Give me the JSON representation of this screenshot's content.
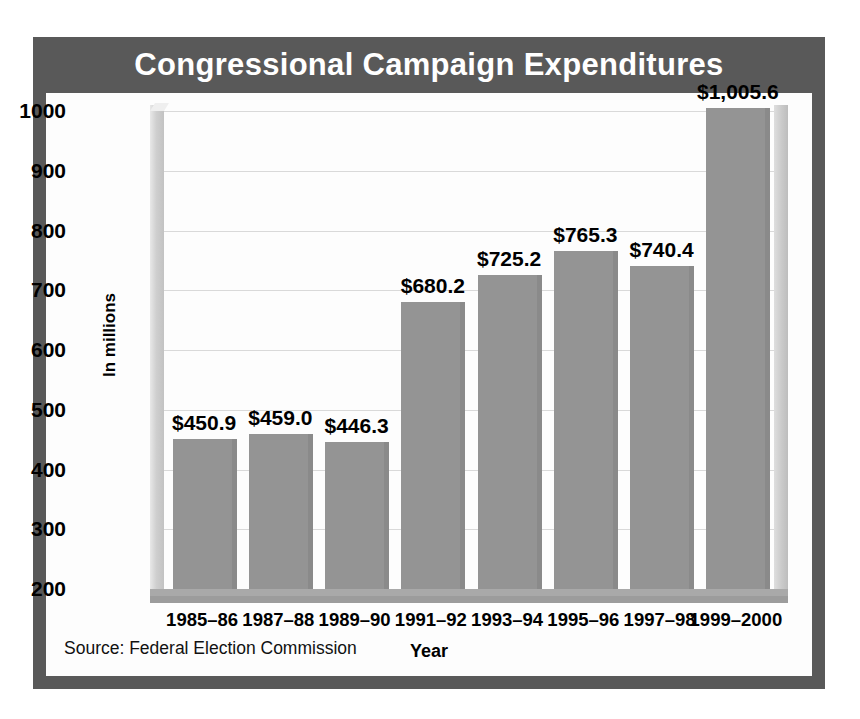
{
  "figure": {
    "title": "Congressional Campaign Expenditures",
    "source_note": "Source: Federal Election Commission",
    "frame_color": "#595959",
    "panel_color": "#fdfdfd",
    "bar_color": "#949494",
    "gridline_color": "#d9d9d9",
    "title_text_color": "#ffffff"
  },
  "chart_data": {
    "type": "bar",
    "title": "Congressional Campaign Expenditures",
    "subtitle": "",
    "xlabel": "Year",
    "ylabel": "In millions",
    "categories": [
      "1985–86",
      "1987–88",
      "1989–90",
      "1991–92",
      "1993–94",
      "1995–96",
      "1997–98",
      "1999–2000"
    ],
    "values": [
      450.9,
      459.0,
      446.3,
      680.2,
      725.2,
      765.3,
      740.4,
      1005.6
    ],
    "data_labels": [
      "$450.9",
      "$459.0",
      "$446.3",
      "$680.2",
      "$725.2",
      "$765.3",
      "$740.4",
      "$1,005.6"
    ],
    "ylim": [
      200,
      1000
    ],
    "ytick_values": [
      1000,
      900,
      800,
      700,
      600,
      500,
      400,
      300,
      200
    ],
    "ytick_labels": [
      "1000",
      "900",
      "800",
      "700",
      "600",
      "500",
      "400",
      "300",
      "200"
    ],
    "grid": true,
    "grid_axis": "y",
    "legend": false,
    "legend_position": "none",
    "annotations": [
      "Source: Federal Election Commission"
    ]
  }
}
